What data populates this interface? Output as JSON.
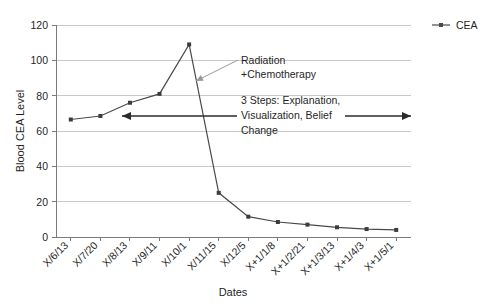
{
  "chart_data": {
    "type": "line",
    "title": "",
    "xlabel": "Dates",
    "ylabel": "Blood CEA Level",
    "ylim": [
      0,
      120
    ],
    "ytick_step": 20,
    "yticks": [
      "0",
      "20",
      "40",
      "60",
      "80",
      "100",
      "120"
    ],
    "grid": true,
    "legend_position": "right",
    "categories": [
      "X/6/13",
      "X/7/20",
      "X/8/13",
      "X/9/11",
      "X/10/1",
      "X/11/15",
      "X/12/5",
      "X+1/1/8",
      "X+1/2/21",
      "X+1/3/13",
      "X+1/4/3",
      "X+1/5/1"
    ],
    "series": [
      {
        "name": "CEA",
        "color": "#4a4a4a",
        "values": [
          66.5,
          68.5,
          76,
          81,
          109,
          25,
          11.5,
          8.5,
          7,
          5.5,
          4.5,
          4
        ]
      }
    ],
    "annotations": [
      {
        "id": "treatment-callout",
        "lines": [
          "Radiation",
          "+Chemotherapy"
        ],
        "text_x": 241,
        "text_y": 64,
        "pointer_from_x": 238,
        "pointer_from_y": 60,
        "pointer_to_x": 196,
        "pointer_to_y": 81
      },
      {
        "id": "three-steps-span",
        "lines": [
          "3 Steps: Explanation,",
          "Visualization, Belief",
          "Change"
        ],
        "text_x": 241,
        "text_y": 104,
        "span_y": 116,
        "span_x_start": 122,
        "span_x_end": 411
      }
    ]
  },
  "legend": {
    "entries": [
      {
        "label": "CEA",
        "color": "#4a4a4a"
      }
    ]
  },
  "axis": {
    "x_title": "Dates",
    "y_title": "Blood CEA Level"
  }
}
